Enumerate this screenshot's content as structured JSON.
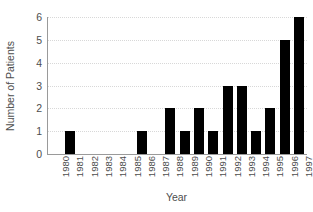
{
  "chart_data": {
    "type": "bar",
    "title": "",
    "xlabel": "Year",
    "ylabel": "Number of Patients",
    "categories": [
      "1980",
      "1981",
      "1982",
      "1983",
      "1984",
      "1985",
      "1986",
      "1987",
      "1988",
      "1989",
      "1990",
      "1991",
      "1992",
      "1993",
      "1994",
      "1995",
      "1996",
      "1997"
    ],
    "values": [
      0,
      1,
      0,
      0,
      0,
      0,
      1,
      0,
      2,
      1,
      2,
      1,
      3,
      3,
      1,
      2,
      5,
      6
    ],
    "ylim": [
      0,
      6
    ],
    "yticks": [
      6,
      5,
      4,
      3,
      2,
      1,
      0
    ],
    "grid": true,
    "legend": false,
    "bar_color": "#000000",
    "axis_color": "#9a9a9a",
    "gridline_color": "#d8d8d8",
    "text_color": "#4d4d4d",
    "background": "#ffffff"
  }
}
